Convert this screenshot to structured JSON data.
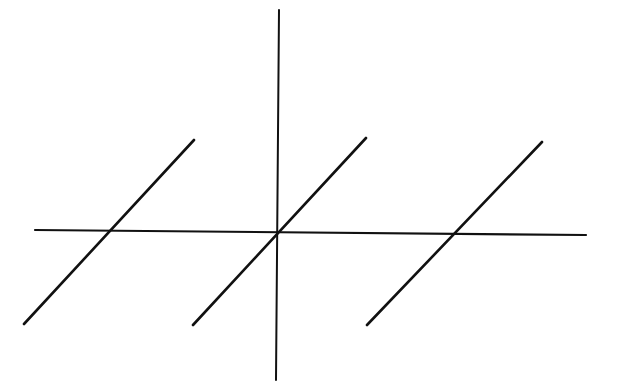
{
  "diagram": {
    "type": "function-graph",
    "stroke_color": "#111111",
    "background_color": "#ffffff",
    "axes": {
      "x_axis": {
        "x1": 35,
        "y1": 230,
        "x2": 586,
        "y2": 235
      },
      "y_axis": {
        "x1": 279,
        "y1": 10,
        "x2": 276,
        "y2": 380
      }
    },
    "segments": [
      {
        "name": "segment-left",
        "x1": 24,
        "y1": 324,
        "x2": 194,
        "y2": 140
      },
      {
        "name": "segment-center",
        "x1": 193,
        "y1": 325,
        "x2": 366,
        "y2": 138
      },
      {
        "name": "segment-right",
        "x1": 367,
        "y1": 325,
        "x2": 542,
        "y2": 142
      }
    ]
  }
}
